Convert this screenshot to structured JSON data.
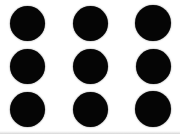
{
  "image": {
    "title": "Black dot grid",
    "description": "Nine solid black circles arranged in a three by three grid on a white background",
    "width": 180,
    "height": 134,
    "background_color": "#ffffff",
    "edge_band_color": "#c8c8c8"
  },
  "grid": {
    "rows": 3,
    "columns": 3,
    "dot_count": 9,
    "dot_color": "#050505",
    "dot_diameter": 35,
    "column_centers": [
      27,
      90,
      153
    ],
    "row_centers": [
      23,
      66,
      109
    ]
  },
  "dots": [
    {
      "name": "dot-r1-c1",
      "cx": 27,
      "cy": 23,
      "d": 35
    },
    {
      "name": "dot-r1-c2",
      "cx": 90,
      "cy": 23,
      "d": 35
    },
    {
      "name": "dot-r1-c3",
      "cx": 153,
      "cy": 23,
      "d": 36
    },
    {
      "name": "dot-r2-c1",
      "cx": 27,
      "cy": 66,
      "d": 35
    },
    {
      "name": "dot-r2-c2",
      "cx": 90,
      "cy": 66,
      "d": 35
    },
    {
      "name": "dot-r2-c3",
      "cx": 153,
      "cy": 66,
      "d": 35
    },
    {
      "name": "dot-r3-c1",
      "cx": 27,
      "cy": 109,
      "d": 35
    },
    {
      "name": "dot-r3-c2",
      "cx": 90,
      "cy": 109,
      "d": 35
    },
    {
      "name": "dot-r3-c3",
      "cx": 153,
      "cy": 109,
      "d": 36
    }
  ]
}
